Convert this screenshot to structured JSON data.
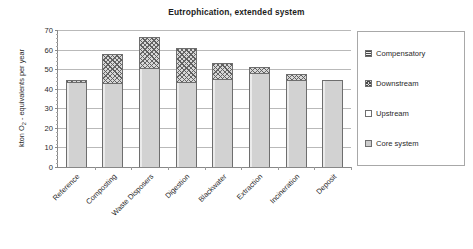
{
  "chart_data": {
    "type": "bar",
    "subtype": "stacked-vertical",
    "title": "Eutrophication, extended system",
    "xlabel": "",
    "ylabel": "kton O2 - equivalents per year",
    "ylabel_rich": {
      "pre": "kton O",
      "sub": "2",
      "post": " - equivalents per year"
    },
    "ylim": [
      0,
      70
    ],
    "ytick_step": 10,
    "yticks": [
      0,
      10,
      20,
      30,
      40,
      50,
      60,
      70
    ],
    "ytick_labels": [
      "0",
      "10",
      "20",
      "30",
      "40",
      "50",
      "60",
      "70"
    ],
    "grid": true,
    "grid_axis": "y",
    "legend_position": "right-outside",
    "categories": [
      "Reference",
      "Composting",
      "Waste Disposers",
      "Digestion",
      "Blackwater",
      "Extraction",
      "Incineration",
      "Deposit"
    ],
    "series": [
      {
        "name": "Core system",
        "pattern": "solid-light-gray",
        "color": "#d2d2d2",
        "values": [
          43.5,
          43.0,
          50.5,
          43.5,
          45.0,
          48.0,
          44.5,
          44.3
        ]
      },
      {
        "name": "Upstream",
        "pattern": "white-empty",
        "color": "#ffffff",
        "values": [
          0,
          0,
          0,
          0,
          0,
          0,
          0,
          0
        ]
      },
      {
        "name": "Downstream",
        "pattern": "cross-hatch",
        "color": "#d8d8d8",
        "values": [
          1.2,
          15.0,
          16.0,
          17.5,
          8.3,
          3.3,
          3.2,
          0
        ]
      },
      {
        "name": "Compensatory",
        "pattern": "horizontal-lines",
        "color": "#efefef",
        "values": [
          0,
          0,
          0,
          0,
          0,
          0,
          0,
          0
        ]
      }
    ],
    "totals": [
      44.7,
      58.0,
      66.5,
      61.0,
      53.3,
      51.3,
      47.7,
      44.3
    ]
  },
  "legend": {
    "entries": [
      {
        "label": "Compensatory",
        "swatch": "horizontal-lines-swatch"
      },
      {
        "label": "Downstream",
        "swatch": "cross-hatch-swatch"
      },
      {
        "label": "Upstream",
        "swatch": "empty-white-swatch"
      },
      {
        "label": "Core system",
        "swatch": "solid-gray-swatch"
      }
    ]
  },
  "colors": {
    "background": "#ffffff",
    "axis": "#888888",
    "gridline": "#b9b9b9",
    "text": "#2a2a2a",
    "core_system": "#d2d2d2",
    "downstream": "#d8d8d8",
    "upstream": "#ffffff",
    "compensatory": "#efefef"
  }
}
